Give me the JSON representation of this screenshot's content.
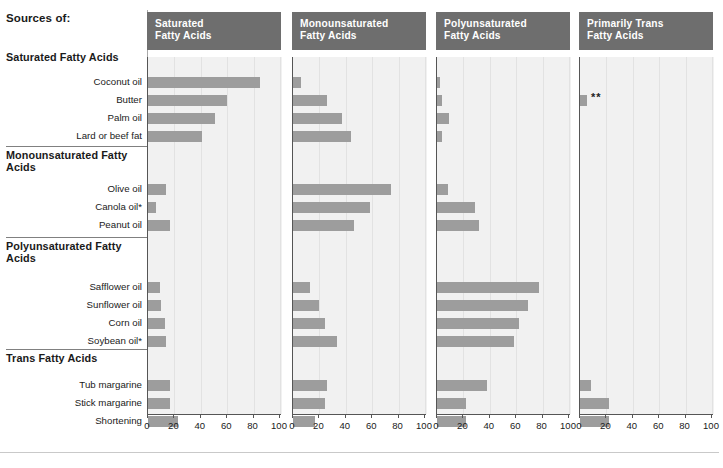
{
  "header": {
    "sources_title": "Sources of:"
  },
  "groups": [
    {
      "name": "Saturated Fatty Acids",
      "rows": [
        "Coconut oil",
        "Butter",
        "Palm oil",
        "Lard or beef fat"
      ]
    },
    {
      "name": "Monounsaturated Fatty Acids",
      "rows": [
        "Olive oil",
        "Canola oil*",
        "Peanut oil"
      ]
    },
    {
      "name": "Polyunsaturated Fatty Acids",
      "rows": [
        "Safflower oil",
        "Sunflower oil",
        "Corn oil",
        "Soybean oil*"
      ]
    },
    {
      "name": "Trans Fatty Acids",
      "rows": [
        "Tub margarine",
        "Stick margarine",
        "Shortening"
      ]
    }
  ],
  "columns": [
    {
      "title": "Saturated Fatty Acids",
      "line1": "Saturated",
      "line2": "Fatty Acids"
    },
    {
      "title": "Monounsaturated Fatty Acids",
      "line1": "Monounsaturated",
      "line2": "Fatty Acids"
    },
    {
      "title": "Polyunsaturated Fatty Acids",
      "line1": "Polyunsaturated",
      "line2": "Fatty Acids"
    },
    {
      "title": "Primarily Trans Fatty Acids",
      "line1": "Primarily Trans",
      "line2": "Fatty Acids"
    }
  ],
  "axis": {
    "ticks": [
      0,
      20,
      40,
      60,
      80,
      100
    ],
    "min": 0,
    "max": 100
  },
  "markers": {
    "butter_trans": "**"
  },
  "colors": {
    "bar": "#9d9d9d",
    "header_bg": "#6e6e6e",
    "plot_bg": "#f1f1f1",
    "axis": "#555555"
  },
  "chart_data": {
    "type": "bar",
    "xlabel": "",
    "ylabel": "",
    "xlim": [
      0,
      100
    ],
    "grid": true,
    "legend_position": "none",
    "categories": [
      "Coconut oil",
      "Butter",
      "Palm oil",
      "Lard or beef fat",
      "Olive oil",
      "Canola oil*",
      "Peanut oil",
      "Safflower oil",
      "Sunflower oil",
      "Corn oil",
      "Soybean oil*",
      "Tub margarine",
      "Stick margarine",
      "Shortening"
    ],
    "category_groups": [
      "Saturated Fatty Acids",
      "Saturated Fatty Acids",
      "Saturated Fatty Acids",
      "Saturated Fatty Acids",
      "Monounsaturated Fatty Acids",
      "Monounsaturated Fatty Acids",
      "Monounsaturated Fatty Acids",
      "Polyunsaturated Fatty Acids",
      "Polyunsaturated Fatty Acids",
      "Polyunsaturated Fatty Acids",
      "Polyunsaturated Fatty Acids",
      "Trans Fatty Acids",
      "Trans Fatty Acids",
      "Trans Fatty Acids"
    ],
    "series": [
      {
        "name": "Saturated Fatty Acids",
        "values": [
          85,
          60,
          51,
          41,
          14,
          6,
          17,
          9,
          10,
          13,
          14,
          17,
          17,
          23
        ]
      },
      {
        "name": "Monounsaturated Fatty Acids",
        "values": [
          6,
          26,
          37,
          44,
          74,
          58,
          46,
          13,
          20,
          24,
          33,
          26,
          24,
          17
        ]
      },
      {
        "name": "Polyunsaturated Fatty Acids",
        "values": [
          2,
          4,
          9,
          4,
          8,
          29,
          32,
          77,
          69,
          62,
          58,
          38,
          22,
          22
        ]
      },
      {
        "name": "Primarily Trans Fatty Acids",
        "values": [
          0,
          5,
          0,
          0,
          0,
          0,
          0,
          0,
          0,
          0,
          0,
          8,
          22,
          22
        ]
      }
    ]
  }
}
